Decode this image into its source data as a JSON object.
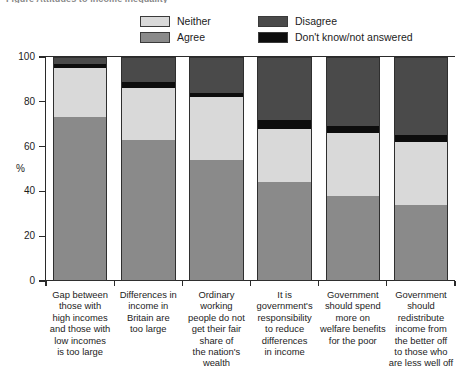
{
  "figure": {
    "title": "Figure   Attitudes to income inequality"
  },
  "legend": {
    "items": [
      {
        "label": "Neither",
        "color": "#d9d9d9"
      },
      {
        "label": "Disagree",
        "color": "#4a4a4a"
      },
      {
        "label": "Agree",
        "color": "#8a8a8a"
      },
      {
        "label": "Don't know/not answered",
        "color": "#0d0d0d"
      }
    ]
  },
  "axes": {
    "y_title": "%",
    "y_ticks": [
      "0",
      "20",
      "40",
      "60",
      "80",
      "100"
    ]
  },
  "chart_data": {
    "type": "bar",
    "title": "Figure   Attitudes to income inequality",
    "stacked": true,
    "xlabel": "",
    "ylabel": "%",
    "ylim": [
      0,
      100
    ],
    "yticks": [
      0,
      20,
      40,
      60,
      80,
      100
    ],
    "grid": false,
    "legend_position": "top",
    "categories": [
      "Gap between those with high incomes and those with low incomes is too large",
      "Differences in income in Britain are too large",
      "Ordinary working people do not get their fair share of the nation's wealth",
      "It is government's responsibility to reduce differences in income",
      "Government should spend more on welfare benefits for the poor",
      "Government should redistribute income from the better off to those who are less well off"
    ],
    "series": [
      {
        "name": "Agree",
        "color": "#8a8a8a",
        "values": [
          73,
          63,
          54,
          44,
          38,
          34
        ]
      },
      {
        "name": "Neither",
        "color": "#d9d9d9",
        "values": [
          22,
          23,
          28,
          24,
          28,
          28
        ]
      },
      {
        "name": "Don't know/not answered",
        "color": "#0d0d0d",
        "values": [
          2,
          3,
          2,
          4,
          3,
          3
        ]
      },
      {
        "name": "Disagree",
        "color": "#4a4a4a",
        "values": [
          3,
          11,
          16,
          28,
          31,
          35
        ]
      }
    ]
  },
  "categories_display": [
    [
      "Gap between",
      "those with",
      "high incomes",
      "and those with",
      "low incomes",
      "is too large"
    ],
    [
      "Differences in",
      "income in",
      "Britain are",
      "too large"
    ],
    [
      "Ordinary",
      "working",
      "people do not",
      "get their fair",
      "share of",
      "the nation's",
      "wealth"
    ],
    [
      "It is",
      "government's",
      "responsibility",
      "to reduce",
      "differences",
      "in income"
    ],
    [
      "Government",
      "should spend",
      "more on",
      "welfare benefits",
      "for the poor"
    ],
    [
      "Government",
      "should",
      "redistribute",
      "income from",
      "the better off",
      "to those who",
      "are less well off"
    ]
  ]
}
